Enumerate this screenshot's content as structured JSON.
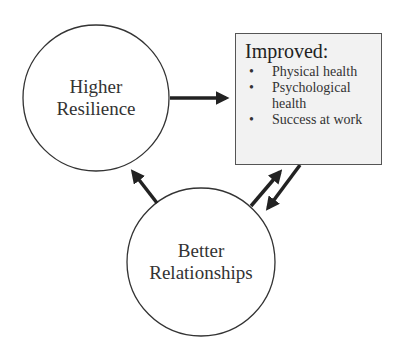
{
  "nodes": {
    "resilience": {
      "line1": "Higher",
      "line2": "Resilience"
    },
    "relationships": {
      "line1": "Better",
      "line2": "Relationships"
    },
    "outcomes": {
      "title": "Improved:",
      "items": [
        "Physical health",
        "Psychological health",
        "Success at work"
      ],
      "bullet": "•"
    }
  },
  "edges": [
    {
      "from": "Higher Resilience",
      "to": "Improved outcomes"
    },
    {
      "from": "Better Relationships",
      "to": "Higher Resilience"
    },
    {
      "from": "Better Relationships",
      "to": "Improved outcomes"
    },
    {
      "from": "Improved outcomes",
      "to": "Better Relationships"
    }
  ],
  "colors": {
    "stroke": "#333333",
    "box_fill": "#f2f2f2"
  }
}
